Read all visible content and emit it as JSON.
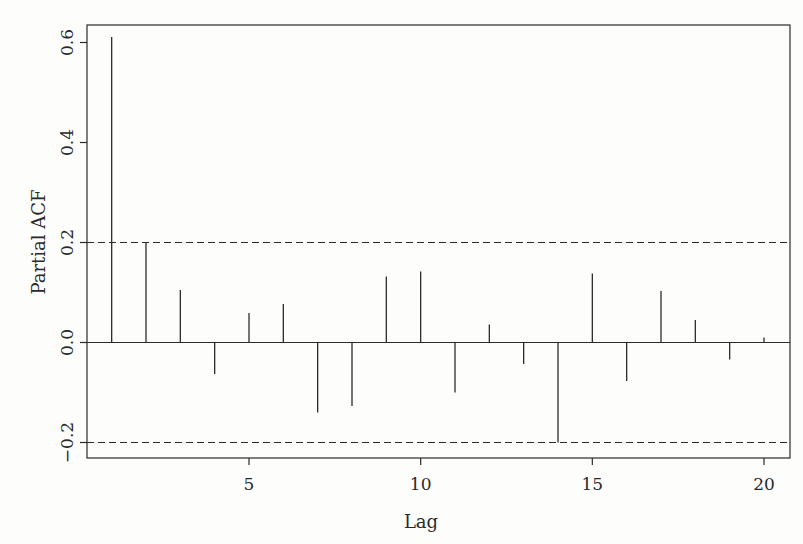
{
  "chart_data": {
    "type": "bar",
    "subtype": "pacf-stem",
    "title": "",
    "xlabel": "Lag",
    "ylabel": "Partial ACF",
    "x": [
      1,
      2,
      3,
      4,
      5,
      6,
      7,
      8,
      9,
      10,
      11,
      12,
      13,
      14,
      15,
      16,
      17,
      18,
      19,
      20
    ],
    "values": [
      0.611,
      0.2,
      0.105,
      -0.063,
      0.059,
      0.077,
      -0.14,
      -0.127,
      0.132,
      0.142,
      -0.1,
      0.036,
      -0.043,
      -0.2,
      0.138,
      -0.077,
      0.103,
      0.045,
      -0.034,
      0.01
    ],
    "confidence_bounds": [
      0.2,
      -0.2
    ],
    "xlim": [
      0.2,
      20.6
    ],
    "ylim": [
      -0.23,
      0.635
    ],
    "xticks": [
      5,
      10,
      15,
      20
    ],
    "xtick_labels": [
      "5",
      "10",
      "15",
      "20"
    ],
    "yticks": [
      -0.2,
      0.0,
      0.2,
      0.4,
      0.6
    ],
    "ytick_labels": [
      "−0.2",
      "0.0",
      "0.2",
      "0.4",
      "0.6"
    ],
    "grid": false,
    "legend": null
  },
  "colors": {
    "line": "#2b2b2b",
    "background": "#fdfdfb"
  }
}
